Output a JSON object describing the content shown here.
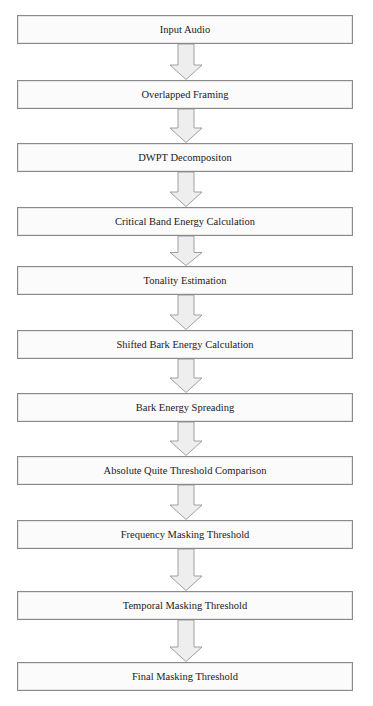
{
  "flowchart": {
    "steps": [
      {
        "label": "Input Audio",
        "top": 15
      },
      {
        "label": "Overlapped Framing",
        "top": 80
      },
      {
        "label": "DWPT Decompositon",
        "top": 143
      },
      {
        "label": "Critical Band Energy Calculation",
        "top": 207
      },
      {
        "label": "Tonality Estimation",
        "top": 266
      },
      {
        "label": "Shifted Bark Energy Calculation",
        "top": 330
      },
      {
        "label": "Bark Energy Spreading",
        "top": 393
      },
      {
        "label": "Absolute Quite Threshold Comparison",
        "top": 456
      },
      {
        "label": "Frequency Masking Threshold",
        "top": 520
      },
      {
        "label": "Temporal Masking Threshold",
        "top": 591
      },
      {
        "label": "Final Masking Threshold",
        "top": 662
      }
    ],
    "colors": {
      "box_border": "#8a8a8a",
      "box_fill": "#fbfbfb",
      "arrow_fill": "#eeeeee",
      "arrow_stroke": "#8a8a8a",
      "text": "#1a1a1a"
    }
  }
}
